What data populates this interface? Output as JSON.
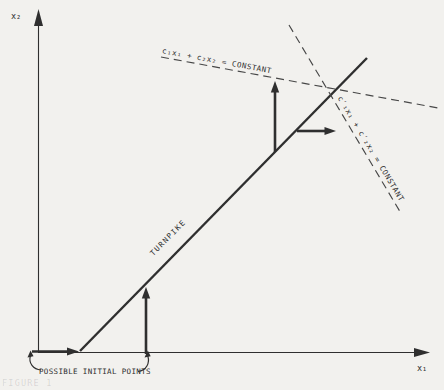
{
  "figure": {
    "type": "turnpike-growth-diagram",
    "colors": {
      "background": "#f2f1ee",
      "ink": "#2f2f2f",
      "dashed": "#474747",
      "caption_ghost": "rgba(47,47,47,0.14)"
    },
    "axes": {
      "y_label": "x₂",
      "x_label": "x₁"
    },
    "labels": {
      "equation_upper": "c₁x₁ + c₂x₂ = CONSTANT",
      "equation_right": "c′₁x₁ + c′₂x₂ = CONSTANT",
      "turnpike": "TURNPIKE",
      "initial_points": "POSSIBLE INITIAL POINTS",
      "caption": "FIGURE 1"
    }
  }
}
